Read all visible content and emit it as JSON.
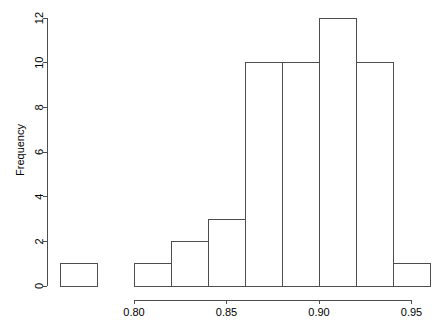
{
  "chart_data": {
    "type": "bar",
    "subtype": "histogram",
    "title": "",
    "xlabel": "",
    "ylabel": "Frequency",
    "grid": false,
    "legend": null,
    "legend_position": "none",
    "bin_width": 0.02,
    "bin_edges": [
      0.76,
      0.78,
      0.8,
      0.82,
      0.84,
      0.86,
      0.88,
      0.9,
      0.92,
      0.94,
      0.96
    ],
    "categories": [
      "0.76-0.78",
      "0.78-0.80",
      "0.80-0.82",
      "0.82-0.84",
      "0.84-0.86",
      "0.86-0.88",
      "0.88-0.90",
      "0.90-0.92",
      "0.92-0.94",
      "0.94-0.96"
    ],
    "values": [
      1,
      0,
      1,
      2,
      3,
      10,
      10,
      12,
      10,
      1
    ],
    "xlim": [
      0.76,
      0.96
    ],
    "ylim": [
      0,
      12
    ],
    "x_ticks": [
      0.8,
      0.85,
      0.9,
      0.95
    ],
    "x_tick_labels": [
      "0.80",
      "0.85",
      "0.90",
      "0.95"
    ],
    "y_ticks": [
      0,
      2,
      4,
      6,
      8,
      10,
      12
    ],
    "y_tick_labels": [
      "0",
      "2",
      "4",
      "6",
      "8",
      "10",
      "12"
    ],
    "bar_stroke_color": "#4d4d4d",
    "bar_fill_color": "none",
    "axis_color": "#4d4d4d",
    "background_color": "#ffffff",
    "total_count": 50
  },
  "layout": {
    "plot_left_px": 60,
    "plot_right_px": 430,
    "plot_top_px": 18,
    "plot_baseline_px": 286,
    "y_axis_x_px": 47,
    "x_axis_y_px": 300
  }
}
